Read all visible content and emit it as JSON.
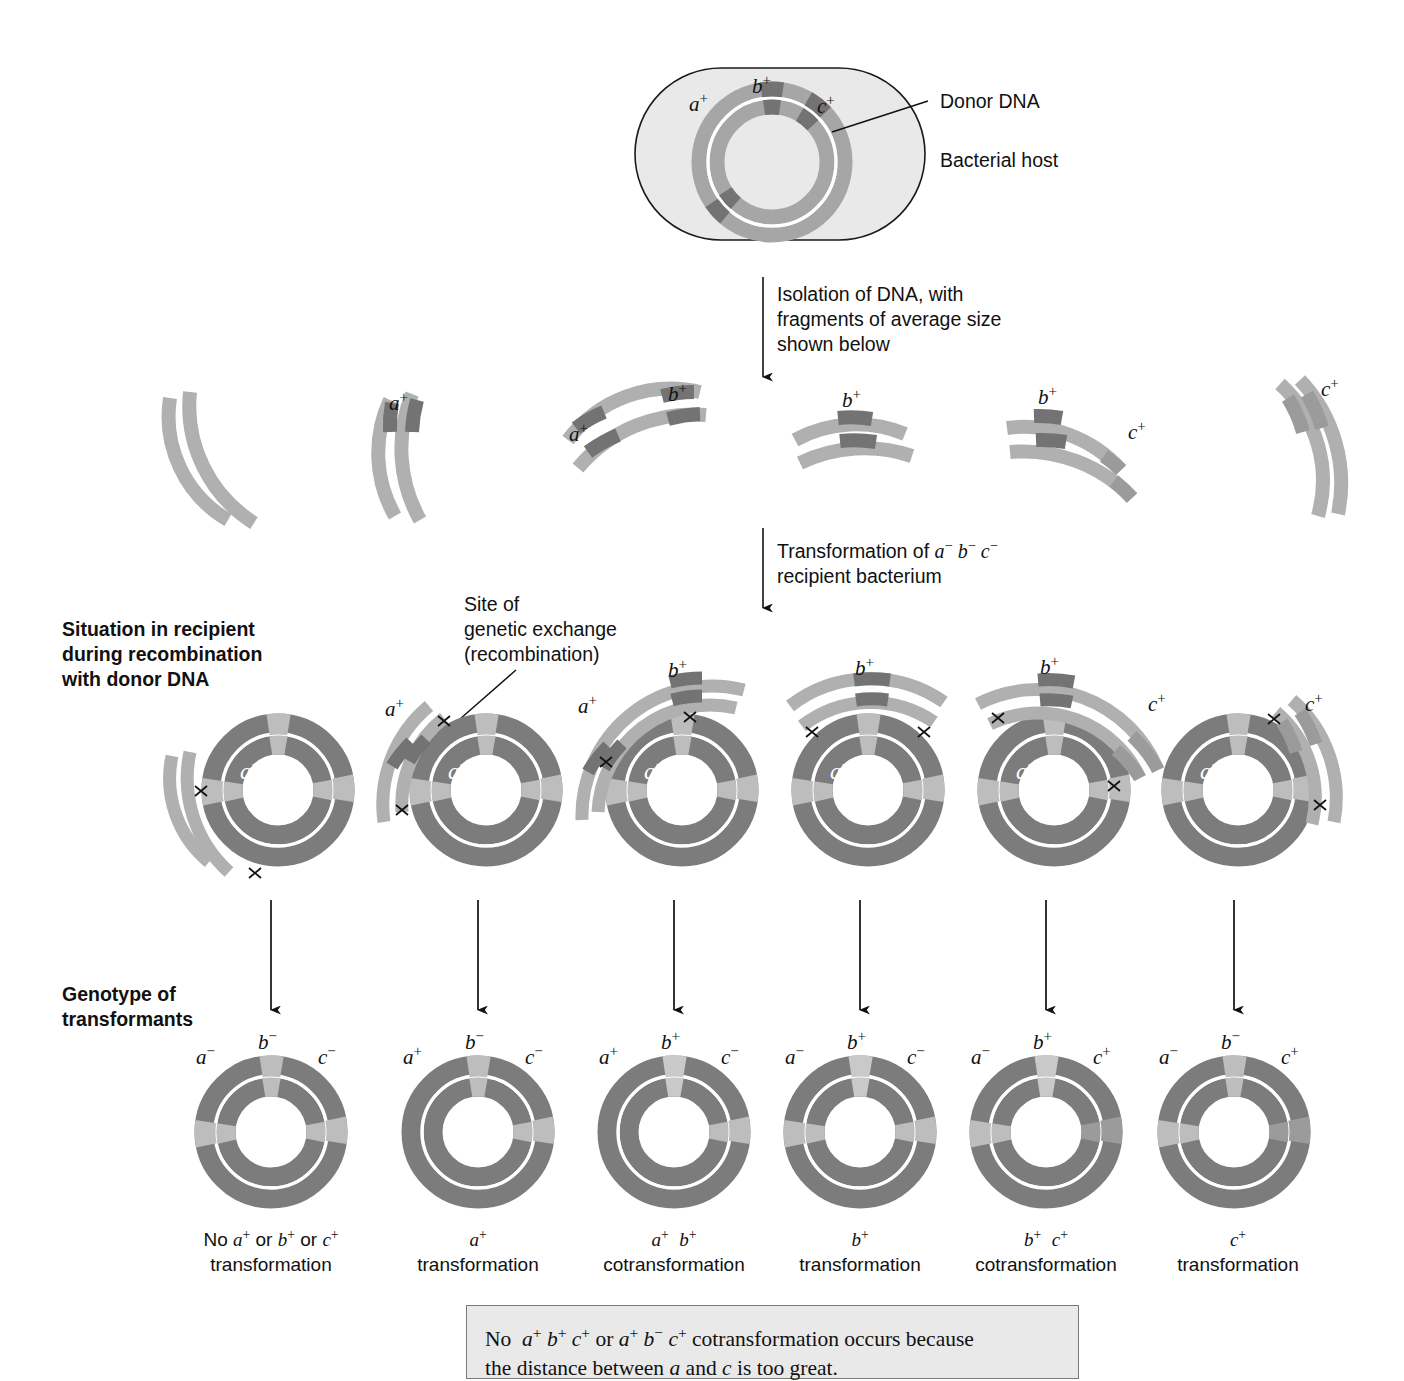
{
  "figure": {
    "colors": {
      "cell_fill": "#e3e3e3",
      "cell_stroke": "#222222",
      "dna_light": "#b4b4b4",
      "dna_mid": "#9a9a9a",
      "dna_dark": "#7a7a7a",
      "recipient_ring": "#7c7c7c",
      "recipient_marker": "#b8b8b8",
      "note_bg": "#e9e9e9",
      "note_border": "#7a7a7a",
      "line": "#111111"
    }
  },
  "top": {
    "donor_label": "Donor DNA",
    "host_label": "Bacterial host",
    "genes": [
      "a",
      "b",
      "c"
    ],
    "gene_labels": [
      "a+",
      "b+",
      "c+"
    ]
  },
  "steps": {
    "isolation": "Isolation of DNA, with\nfragments of average size\nshown below",
    "transformation_line1": "Transformation of ",
    "transformation_genotype": "a− b− c−",
    "transformation_line2": "recipient bacterium"
  },
  "annotations": {
    "exchange_site": "Site of\ngenetic exchange\n(recombination)",
    "row_label_recombination": "Situation in recipient\nduring recombination\nwith donor DNA",
    "row_label_genotype": "Genotype of\ntransformants"
  },
  "fragments": [
    {
      "id": "frag-1",
      "markers": [],
      "labels": []
    },
    {
      "id": "frag-2",
      "markers": [
        "a+"
      ],
      "labels": [
        "a+"
      ]
    },
    {
      "id": "frag-3",
      "markers": [
        "a+",
        "b+"
      ],
      "labels": [
        "a+",
        "b+"
      ]
    },
    {
      "id": "frag-4",
      "markers": [
        "b+"
      ],
      "labels": [
        "b+"
      ]
    },
    {
      "id": "frag-5",
      "markers": [
        "b+",
        "c+"
      ],
      "labels": [
        "b+",
        "c+"
      ]
    },
    {
      "id": "frag-6",
      "markers": [
        "c+"
      ],
      "labels": [
        "c+"
      ]
    }
  ],
  "recipient": {
    "center_genotype": "a−b−c−",
    "center_parts": [
      "a",
      "b",
      "c"
    ]
  },
  "columns": [
    {
      "id": "col-1",
      "donor_fragment_labels": [],
      "crossovers": 2,
      "result_labels": [
        "a−",
        "b−",
        "c−"
      ],
      "result_alleles": {
        "a": "-",
        "b": "-",
        "c": "-"
      },
      "caption_line1": "No a+ or b+ or c+",
      "caption_line2": "transformation"
    },
    {
      "id": "col-2",
      "donor_fragment_labels": [
        "a+"
      ],
      "crossovers": 2,
      "result_labels": [
        "a+",
        "b−",
        "c−"
      ],
      "result_alleles": {
        "a": "+",
        "b": "-",
        "c": "-"
      },
      "caption_line1": "a+",
      "caption_line2": "transformation"
    },
    {
      "id": "col-3",
      "donor_fragment_labels": [
        "a+",
        "b+"
      ],
      "crossovers": 2,
      "result_labels": [
        "a+",
        "b+",
        "c−"
      ],
      "result_alleles": {
        "a": "+",
        "b": "+",
        "c": "-"
      },
      "caption_line1": "a+ b+",
      "caption_line2": "cotransformation"
    },
    {
      "id": "col-4",
      "donor_fragment_labels": [
        "b+"
      ],
      "crossovers": 2,
      "result_labels": [
        "a−",
        "b+",
        "c−"
      ],
      "result_alleles": {
        "a": "-",
        "b": "+",
        "c": "-"
      },
      "caption_line1": "b+",
      "caption_line2": "transformation"
    },
    {
      "id": "col-5",
      "donor_fragment_labels": [
        "b+",
        "c+"
      ],
      "crossovers": 2,
      "result_labels": [
        "a−",
        "b+",
        "c+"
      ],
      "result_alleles": {
        "a": "-",
        "b": "+",
        "c": "+"
      },
      "caption_line1": "b+ c+",
      "caption_line2": "cotransformation"
    },
    {
      "id": "col-6",
      "donor_fragment_labels": [
        "c+"
      ],
      "crossovers": 2,
      "result_labels": [
        "a−",
        "b−",
        "c+"
      ],
      "result_alleles": {
        "a": "-",
        "b": "-",
        "c": "+"
      },
      "caption_line1": "c+",
      "caption_line2": "transformation"
    }
  ],
  "note": {
    "text_line1_a": "No ",
    "text_line1_b": " or ",
    "text_line1_c": " cotransformation occurs because",
    "genotype1": "a+ b+ c+",
    "genotype2": "a+ b− c+",
    "text_line2_a": "the distance between ",
    "gene_a": "a",
    "text_line2_b": " and ",
    "gene_c": "c",
    "text_line2_c": " is too great."
  }
}
